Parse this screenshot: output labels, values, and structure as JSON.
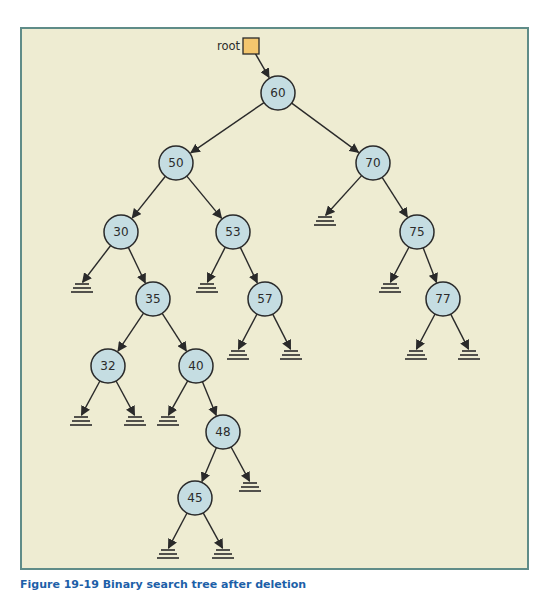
{
  "diagram": {
    "type": "binary-search-tree",
    "root_pointer": {
      "label": "root",
      "box_color": "#f3c66e"
    },
    "colors": {
      "background": "#eeecd2",
      "border": "#5f8c88",
      "node_fill": "#c5dde2",
      "stroke": "#2a2a2a"
    },
    "nodes": [
      {
        "id": "n60",
        "value": "60",
        "x": 278,
        "y": 93,
        "left": "n50",
        "right": "n70"
      },
      {
        "id": "n50",
        "value": "50",
        "x": 176,
        "y": 163,
        "left": "n30",
        "right": "n53"
      },
      {
        "id": "n70",
        "value": "70",
        "x": 373,
        "y": 163,
        "left": null,
        "right": "n75"
      },
      {
        "id": "n30",
        "value": "30",
        "x": 121,
        "y": 232,
        "left": null,
        "right": "n35"
      },
      {
        "id": "n53",
        "value": "53",
        "x": 233,
        "y": 232,
        "left": null,
        "right": "n57"
      },
      {
        "id": "n75",
        "value": "75",
        "x": 417,
        "y": 232,
        "left": null,
        "right": "n77"
      },
      {
        "id": "n35",
        "value": "35",
        "x": 153,
        "y": 299,
        "left": "n32",
        "right": "n40"
      },
      {
        "id": "n57",
        "value": "57",
        "x": 265,
        "y": 299,
        "left": null,
        "right": null
      },
      {
        "id": "n77",
        "value": "77",
        "x": 443,
        "y": 299,
        "left": null,
        "right": null
      },
      {
        "id": "n32",
        "value": "32",
        "x": 108,
        "y": 366,
        "left": null,
        "right": null
      },
      {
        "id": "n40",
        "value": "40",
        "x": 196,
        "y": 366,
        "left": null,
        "right": "n48"
      },
      {
        "id": "n48",
        "value": "48",
        "x": 223,
        "y": 432,
        "left": "n45",
        "right": null
      },
      {
        "id": "n45",
        "value": "45",
        "x": 195,
        "y": 498,
        "left": null,
        "right": null
      }
    ],
    "null_markers": [
      {
        "parent": "n70",
        "side": "left",
        "x": 325,
        "y": 216
      },
      {
        "parent": "n30",
        "side": "left",
        "x": 82,
        "y": 283
      },
      {
        "parent": "n53",
        "side": "left",
        "x": 207,
        "y": 283
      },
      {
        "parent": "n75",
        "side": "left",
        "x": 390,
        "y": 283
      },
      {
        "parent": "n57",
        "side": "left",
        "x": 238,
        "y": 350
      },
      {
        "parent": "n57",
        "side": "right",
        "x": 291,
        "y": 350
      },
      {
        "parent": "n77",
        "side": "left",
        "x": 416,
        "y": 350
      },
      {
        "parent": "n77",
        "side": "right",
        "x": 469,
        "y": 350
      },
      {
        "parent": "n32",
        "side": "left",
        "x": 81,
        "y": 416
      },
      {
        "parent": "n32",
        "side": "right",
        "x": 135,
        "y": 416
      },
      {
        "parent": "n40",
        "side": "left",
        "x": 168,
        "y": 416
      },
      {
        "parent": "n48",
        "side": "right",
        "x": 250,
        "y": 482
      },
      {
        "parent": "n45",
        "side": "left",
        "x": 168,
        "y": 549
      },
      {
        "parent": "n45",
        "side": "right",
        "x": 223,
        "y": 549
      }
    ]
  },
  "caption": {
    "text": "Figure 19-19  Binary search tree after deletion"
  }
}
